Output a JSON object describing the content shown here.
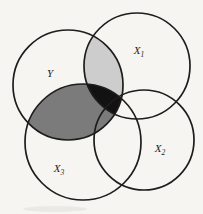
{
  "figure": {
    "canvas": {
      "width": 203,
      "height": 214
    },
    "background_color": "#f6f5f2",
    "stroke": {
      "color": "#1d1d1d",
      "width": 1.7
    },
    "circles": [
      {
        "id": "Y",
        "label": "Y",
        "sub": "",
        "cx": 68,
        "cy": 85,
        "r": 55,
        "label_x": 50,
        "label_y": 77
      },
      {
        "id": "X1",
        "label": "X",
        "sub": "1",
        "cx": 137,
        "cy": 66,
        "r": 53,
        "label_x": 139,
        "label_y": 54
      },
      {
        "id": "X2",
        "label": "X",
        "sub": "2",
        "cx": 144,
        "cy": 140,
        "r": 50,
        "label_x": 160,
        "label_y": 152
      },
      {
        "id": "X3",
        "label": "X",
        "sub": "3",
        "cx": 83,
        "cy": 142,
        "r": 58,
        "label_x": 59,
        "label_y": 172
      }
    ],
    "regions": [
      {
        "id": "y-x1",
        "name": "Y intersect X1",
        "of": [
          "Y",
          "X1"
        ],
        "color": "#cdcdcd"
      },
      {
        "id": "y-x3",
        "name": "Y intersect X3",
        "of": [
          "Y",
          "X3"
        ],
        "color": "#7b7b7b"
      },
      {
        "id": "y-x1-x3",
        "name": "Y intersect X1 intersect X3",
        "of": [
          "Y",
          "X1",
          "X3"
        ],
        "color": "#121212"
      }
    ],
    "scan_smudge": {
      "cx": 55,
      "cy": 209,
      "rx": 32,
      "ry": 3,
      "color": "#e6e4e0"
    }
  }
}
